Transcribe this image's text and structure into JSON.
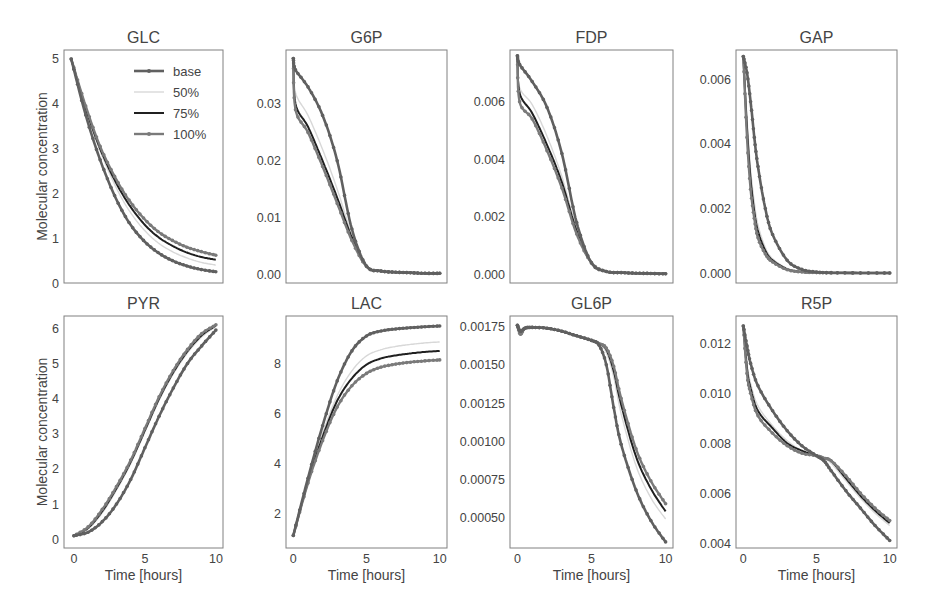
{
  "figure": {
    "ylabel": "Molecular concentration",
    "xlabel": "Time [hours]",
    "legend": {
      "entries": [
        "base",
        "50%",
        "75%",
        "100%"
      ]
    },
    "series_styles": [
      {
        "name": "base",
        "color": "#606060",
        "width": 2.6,
        "markers": true
      },
      {
        "name": "50%",
        "color": "#d8d8d8",
        "width": 1.4,
        "markers": false
      },
      {
        "name": "75%",
        "color": "#202020",
        "width": 2.0,
        "markers": false
      },
      {
        "name": "100%",
        "color": "#7a7a7a",
        "width": 2.4,
        "markers": true
      }
    ]
  },
  "chart_data": [
    {
      "type": "line",
      "title": "GLC",
      "xlabel": "",
      "ylabel": "Molecular concentration",
      "xlim": [
        -0.5,
        10.5
      ],
      "ylim": [
        0,
        5.2
      ],
      "yticks": [
        0,
        1,
        2,
        3,
        4,
        5
      ],
      "ytick_labels": [
        "0",
        "1",
        "2",
        "3",
        "4",
        "5"
      ],
      "xticks": [],
      "legend": true,
      "x": [
        0,
        1,
        2,
        3,
        4,
        5,
        6,
        7,
        8,
        9,
        10
      ],
      "series": [
        {
          "name": "base",
          "values": [
            5.0,
            3.75,
            2.75,
            1.95,
            1.35,
            0.95,
            0.68,
            0.5,
            0.38,
            0.3,
            0.25
          ]
        },
        {
          "name": "50%",
          "values": [
            5.0,
            3.85,
            2.95,
            2.2,
            1.62,
            1.2,
            0.9,
            0.7,
            0.56,
            0.46,
            0.4
          ]
        },
        {
          "name": "75%",
          "values": [
            5.0,
            3.9,
            3.0,
            2.3,
            1.75,
            1.33,
            1.03,
            0.83,
            0.68,
            0.58,
            0.52
          ]
        },
        {
          "name": "100%",
          "values": [
            5.0,
            3.95,
            3.05,
            2.38,
            1.85,
            1.45,
            1.15,
            0.95,
            0.8,
            0.7,
            0.62
          ]
        }
      ]
    },
    {
      "type": "line",
      "title": "G6P",
      "xlabel": "",
      "ylabel": "",
      "xlim": [
        -0.5,
        10.5
      ],
      "ylim": [
        -0.0015,
        0.0395
      ],
      "yticks": [
        0,
        0.01,
        0.02,
        0.03
      ],
      "ytick_labels": [
        "0.00",
        "0.01",
        "0.02",
        "0.03"
      ],
      "xticks": [],
      "legend": false,
      "x": [
        0,
        0.15,
        1,
        2,
        3,
        4,
        5,
        6,
        7,
        8,
        9,
        10
      ],
      "series": [
        {
          "name": "base",
          "values": [
            0.038,
            0.036,
            0.033,
            0.028,
            0.02,
            0.008,
            0.0015,
            0.0006,
            0.0004,
            0.0003,
            0.0002,
            0.0002
          ]
        },
        {
          "name": "50%",
          "values": [
            0.038,
            0.032,
            0.028,
            0.022,
            0.015,
            0.007,
            0.0015,
            0.0006,
            0.0004,
            0.0003,
            0.0002,
            0.0002
          ]
        },
        {
          "name": "75%",
          "values": [
            0.038,
            0.03,
            0.026,
            0.02,
            0.0135,
            0.0065,
            0.0015,
            0.0006,
            0.0004,
            0.0003,
            0.0002,
            0.0002
          ]
        },
        {
          "name": "100%",
          "values": [
            0.038,
            0.029,
            0.025,
            0.019,
            0.0125,
            0.006,
            0.0014,
            0.0006,
            0.0004,
            0.0003,
            0.0002,
            0.0002
          ]
        }
      ]
    },
    {
      "type": "line",
      "title": "FDP",
      "xlabel": "",
      "ylabel": "",
      "xlim": [
        -0.5,
        10.5
      ],
      "ylim": [
        -0.0003,
        0.0078
      ],
      "yticks": [
        0,
        0.002,
        0.004,
        0.006
      ],
      "ytick_labels": [
        "0.000",
        "0.002",
        "0.004",
        "0.006"
      ],
      "xticks": [],
      "legend": false,
      "x": [
        0,
        0.15,
        1,
        2,
        3,
        4,
        5,
        6,
        7,
        8,
        9,
        10
      ],
      "series": [
        {
          "name": "base",
          "values": [
            0.0076,
            0.0073,
            0.0067,
            0.0058,
            0.0042,
            0.0018,
            0.0004,
            0.0001,
            6e-05,
            4e-05,
            3e-05,
            2e-05
          ]
        },
        {
          "name": "50%",
          "values": [
            0.0076,
            0.0065,
            0.0059,
            0.0048,
            0.0034,
            0.0016,
            0.0004,
            0.0001,
            6e-05,
            4e-05,
            3e-05,
            2e-05
          ]
        },
        {
          "name": "75%",
          "values": [
            0.0076,
            0.0063,
            0.0056,
            0.0045,
            0.0032,
            0.0015,
            0.0004,
            0.0001,
            6e-05,
            4e-05,
            3e-05,
            2e-05
          ]
        },
        {
          "name": "100%",
          "values": [
            0.0076,
            0.006,
            0.0054,
            0.0043,
            0.003,
            0.0014,
            0.0004,
            0.0001,
            6e-05,
            4e-05,
            3e-05,
            2e-05
          ]
        }
      ]
    },
    {
      "type": "line",
      "title": "GAP",
      "xlabel": "",
      "ylabel": "",
      "xlim": [
        -0.5,
        10.5
      ],
      "ylim": [
        -0.0003,
        0.0069
      ],
      "yticks": [
        0,
        0.002,
        0.004,
        0.006
      ],
      "ytick_labels": [
        "0.000",
        "0.002",
        "0.004",
        "0.006"
      ],
      "xticks": [],
      "legend": false,
      "x": [
        0,
        0.25,
        0.5,
        0.75,
        1,
        1.5,
        2,
        3,
        4,
        5,
        6,
        8,
        10
      ],
      "series": [
        {
          "name": "base",
          "values": [
            0.0067,
            0.0062,
            0.0053,
            0.0042,
            0.0033,
            0.002,
            0.0012,
            0.0004,
            0.00012,
            4e-05,
            2e-05,
            1e-05,
            1e-05
          ]
        },
        {
          "name": "50%",
          "values": [
            0.0067,
            0.0048,
            0.0032,
            0.0022,
            0.0015,
            0.0008,
            0.00045,
            0.00015,
            5e-05,
            2e-05,
            1e-05,
            1e-05,
            1e-05
          ]
        },
        {
          "name": "75%",
          "values": [
            0.0067,
            0.0045,
            0.0029,
            0.0019,
            0.0013,
            0.0007,
            0.0004,
            0.00013,
            4e-05,
            2e-05,
            1e-05,
            1e-05,
            1e-05
          ]
        },
        {
          "name": "100%",
          "values": [
            0.0067,
            0.0042,
            0.0026,
            0.0017,
            0.0011,
            0.0006,
            0.00035,
            0.00011,
            4e-05,
            2e-05,
            1e-05,
            1e-05,
            1e-05
          ]
        }
      ]
    },
    {
      "type": "line",
      "title": "PYR",
      "xlabel": "Time [hours]",
      "ylabel": "Molecular concentration",
      "xlim": [
        -0.7,
        10.5
      ],
      "ylim": [
        -0.25,
        6.35
      ],
      "yticks": [
        0,
        1,
        2,
        3,
        4,
        5,
        6
      ],
      "ytick_labels": [
        "0",
        "1",
        "2",
        "3",
        "4",
        "5",
        "6"
      ],
      "xticks": [
        0,
        5,
        10
      ],
      "xtick_labels": [
        "0",
        "5",
        "10"
      ],
      "legend": false,
      "x": [
        0,
        1,
        2,
        3,
        4,
        5,
        6,
        7,
        8,
        9,
        10
      ],
      "series": [
        {
          "name": "base",
          "values": [
            0.1,
            0.2,
            0.5,
            1.0,
            1.7,
            2.6,
            3.5,
            4.3,
            5.0,
            5.5,
            5.95
          ]
        },
        {
          "name": "50%",
          "values": [
            0.1,
            0.3,
            0.75,
            1.4,
            2.15,
            3.05,
            3.95,
            4.7,
            5.3,
            5.75,
            6.05
          ]
        },
        {
          "name": "75%",
          "values": [
            0.1,
            0.32,
            0.8,
            1.45,
            2.2,
            3.1,
            4.0,
            4.75,
            5.35,
            5.8,
            6.08
          ]
        },
        {
          "name": "100%",
          "values": [
            0.1,
            0.35,
            0.85,
            1.5,
            2.25,
            3.15,
            4.05,
            4.8,
            5.4,
            5.85,
            6.1
          ]
        }
      ]
    },
    {
      "type": "line",
      "title": "LAC",
      "xlabel": "Time [hours]",
      "ylabel": "",
      "xlim": [
        -0.5,
        10.5
      ],
      "ylim": [
        0.6,
        9.9
      ],
      "yticks": [
        2,
        4,
        6,
        8
      ],
      "ytick_labels": [
        "2",
        "4",
        "6",
        "8"
      ],
      "xticks": [
        0,
        5,
        10
      ],
      "xtick_labels": [
        "0",
        "5",
        "10"
      ],
      "legend": false,
      "x": [
        0,
        1,
        2,
        3,
        4,
        5,
        6,
        7,
        8,
        9,
        10
      ],
      "series": [
        {
          "name": "base",
          "values": [
            1.1,
            3.4,
            5.5,
            7.3,
            8.5,
            9.1,
            9.3,
            9.38,
            9.43,
            9.47,
            9.5
          ]
        },
        {
          "name": "50%",
          "values": [
            1.1,
            3.3,
            5.2,
            6.7,
            7.7,
            8.3,
            8.55,
            8.68,
            8.76,
            8.82,
            8.86
          ]
        },
        {
          "name": "75%",
          "values": [
            1.1,
            3.25,
            5.05,
            6.5,
            7.4,
            7.95,
            8.2,
            8.32,
            8.4,
            8.46,
            8.5
          ]
        },
        {
          "name": "100%",
          "values": [
            1.1,
            3.2,
            4.9,
            6.25,
            7.1,
            7.6,
            7.85,
            7.97,
            8.05,
            8.1,
            8.14
          ]
        }
      ]
    },
    {
      "type": "line",
      "title": "GL6P",
      "xlabel": "Time [hours]",
      "ylabel": "",
      "xlim": [
        -0.5,
        10.5
      ],
      "ylim": [
        0.0003,
        0.00182
      ],
      "yticks": [
        0.0005,
        0.00075,
        0.001,
        0.00125,
        0.0015,
        0.00175
      ],
      "ytick_labels": [
        "0.00050",
        "0.00075",
        "0.00100",
        "0.00125",
        "0.00150",
        "0.00175"
      ],
      "xticks": [
        0,
        5,
        10
      ],
      "xtick_labels": [
        "0",
        "5",
        "10"
      ],
      "legend": false,
      "x": [
        0,
        0.2,
        0.5,
        1,
        2,
        3,
        4,
        5,
        5.5,
        6,
        6.5,
        7,
        8,
        9,
        10
      ],
      "series": [
        {
          "name": "base",
          "values": [
            0.00176,
            0.00172,
            0.00174,
            0.001745,
            0.00174,
            0.00172,
            0.00169,
            0.00166,
            0.00163,
            0.0015,
            0.00122,
            0.00098,
            0.00068,
            0.00048,
            0.00034
          ]
        },
        {
          "name": "50%",
          "values": [
            0.00176,
            0.00172,
            0.00174,
            0.001745,
            0.00174,
            0.00172,
            0.00169,
            0.00166,
            0.00164,
            0.00158,
            0.00142,
            0.00118,
            0.00084,
            0.00063,
            0.00049
          ]
        },
        {
          "name": "75%",
          "values": [
            0.00176,
            0.00171,
            0.00174,
            0.001745,
            0.00174,
            0.00172,
            0.00169,
            0.00166,
            0.00164,
            0.0016,
            0.00146,
            0.00124,
            0.0009,
            0.00069,
            0.00054
          ]
        },
        {
          "name": "100%",
          "values": [
            0.00176,
            0.0017,
            0.00174,
            0.001745,
            0.00174,
            0.00172,
            0.00169,
            0.00166,
            0.00164,
            0.00161,
            0.00149,
            0.00128,
            0.00095,
            0.00074,
            0.00059
          ]
        }
      ]
    },
    {
      "type": "line",
      "title": "R5P",
      "xlabel": "Time [hours]",
      "ylabel": "",
      "xlim": [
        -0.5,
        10.5
      ],
      "ylim": [
        0.0038,
        0.0131
      ],
      "yticks": [
        0.004,
        0.006,
        0.008,
        0.01,
        0.012
      ],
      "ytick_labels": [
        "0.004",
        "0.006",
        "0.008",
        "0.010",
        "0.012"
      ],
      "xticks": [
        0,
        5,
        10
      ],
      "xtick_labels": [
        "0",
        "5",
        "10"
      ],
      "legend": false,
      "x": [
        0,
        0.25,
        0.5,
        1,
        2,
        3,
        4,
        5,
        5.5,
        6,
        7,
        8,
        9,
        10
      ],
      "series": [
        {
          "name": "base",
          "values": [
            0.0127,
            0.0119,
            0.0112,
            0.0103,
            0.0093,
            0.0085,
            0.0079,
            0.0075,
            0.0073,
            0.0069,
            0.0061,
            0.0054,
            0.0047,
            0.0041
          ]
        },
        {
          "name": "50%",
          "values": [
            0.0127,
            0.0112,
            0.0104,
            0.0095,
            0.0087,
            0.0081,
            0.0077,
            0.0075,
            0.0074,
            0.0072,
            0.0065,
            0.0058,
            0.0052,
            0.0047
          ]
        },
        {
          "name": "75%",
          "values": [
            0.0127,
            0.011,
            0.0102,
            0.0093,
            0.0086,
            0.008,
            0.0077,
            0.0075,
            0.0074,
            0.0073,
            0.0066,
            0.0059,
            0.0053,
            0.0048
          ]
        },
        {
          "name": "100%",
          "values": [
            0.0127,
            0.0108,
            0.01,
            0.0091,
            0.0084,
            0.0079,
            0.0076,
            0.0075,
            0.0074,
            0.0073,
            0.0067,
            0.006,
            0.0054,
            0.0049
          ]
        }
      ]
    }
  ]
}
